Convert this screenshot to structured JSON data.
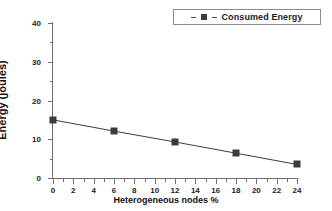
{
  "chart_data": {
    "type": "line",
    "title": "",
    "xlabel": "Heterogeneous nodes %",
    "ylabel": "Energy (joules)",
    "xlim": [
      0,
      24
    ],
    "ylim": [
      0,
      40
    ],
    "grid": false,
    "legend_position": "top-right",
    "x": [
      0,
      6,
      12,
      18,
      24
    ],
    "series": [
      {
        "name": "Consumed Energy",
        "marker": "square",
        "line_style": "solid",
        "color": "#3c3c3c",
        "values": [
          15.0,
          12.1,
          9.3,
          6.4,
          3.5
        ]
      }
    ],
    "xticks": [
      0,
      2,
      4,
      6,
      8,
      10,
      12,
      14,
      16,
      18,
      20,
      22,
      24
    ],
    "xtick_labels": [
      "0",
      "2",
      "4",
      "6",
      "8",
      "10",
      "12",
      "14",
      "16",
      "18",
      "20",
      "22",
      "24"
    ],
    "yticks": [
      0,
      10,
      20,
      30,
      40
    ],
    "ytick_labels": [
      "0",
      "10",
      "20",
      "30",
      "40"
    ],
    "y_minor_ticks": [
      5,
      15,
      25,
      35
    ],
    "x_minor_ticks": [
      1,
      3,
      5,
      7,
      9,
      11,
      13,
      15,
      17,
      19,
      21,
      23
    ]
  },
  "legend": {
    "entries": [
      {
        "label": "Consumed Energy"
      }
    ]
  },
  "colors": {
    "series": "#3c3c3c",
    "axis": "#6e6e6e",
    "text": "#1a1a1a",
    "background": "#ffffff",
    "legend_border": "#8a8a8a"
  }
}
